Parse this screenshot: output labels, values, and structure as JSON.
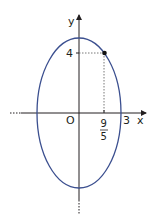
{
  "diagram": {
    "type": "ellipse-graph",
    "equation_implied": "x^2/9 + y^2/25 = 1",
    "colors": {
      "ellipse": "#3b4f8f",
      "axes": "#231f20",
      "guides": "#555555",
      "point": "#111111"
    },
    "axes": {
      "x_label": "x",
      "y_label": "y",
      "origin_label": "O"
    },
    "ticks": {
      "x_tick_3": "3",
      "x_tick_frac_num": "9",
      "x_tick_frac_den": "5",
      "y_tick_4": "4"
    },
    "point": {
      "x": "9/5",
      "y": "4"
    },
    "ellipse": {
      "semi_axis_x": 3,
      "semi_axis_y": 5,
      "center": [
        0,
        0
      ]
    }
  }
}
